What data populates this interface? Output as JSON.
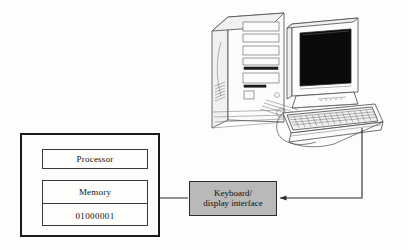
{
  "diagram": {
    "system_box": {
      "name": "computer system enclosure"
    },
    "blocks": [
      {
        "id": "processor",
        "label": "Processor"
      },
      {
        "id": "memory",
        "label": "Memory"
      }
    ],
    "memory_contents": "01000001",
    "interface": {
      "label_line_1": "Keyboard/",
      "label_line_2": "display interface",
      "fill_color": "#b9b9b9"
    },
    "hardware": [
      {
        "id": "tower",
        "label": "computer tower"
      },
      {
        "id": "monitor",
        "label": "CRT monitor"
      },
      {
        "id": "keyboard",
        "label": "keyboard"
      }
    ],
    "connections": [
      {
        "from": "keyboard",
        "to": "interface",
        "direction": "left"
      },
      {
        "from": "interface",
        "to": "memory",
        "direction": "left"
      }
    ],
    "colors": {
      "background": "#fdfdfb",
      "outline": "#1a1a1a",
      "wire": "#2a2a2a",
      "screen": "#0a0a0a"
    }
  }
}
